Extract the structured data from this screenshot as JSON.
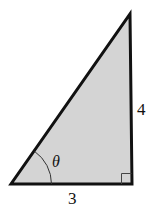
{
  "diagram": {
    "type": "right-triangle",
    "vertices": {
      "bottom_left": [
        11,
        184
      ],
      "bottom_right": [
        132,
        184
      ],
      "top": [
        130,
        14
      ]
    },
    "fill_color": "#d4d4d4",
    "stroke_color": "#111111",
    "labels": {
      "base": "3",
      "height": "4",
      "angle": "θ"
    },
    "right_angle_marker": true
  }
}
